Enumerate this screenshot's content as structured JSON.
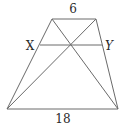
{
  "figure": {
    "type": "trapezoid",
    "labels": {
      "top_base": "6",
      "bottom_base": "18",
      "left_point": "X",
      "right_point": "Y"
    },
    "vertices": {
      "top_left": [
        52,
        19
      ],
      "top_right": [
        96,
        19
      ],
      "bottom_left": [
        7,
        109
      ],
      "bottom_right": [
        118,
        109
      ]
    },
    "segment_xy": {
      "from": [
        40,
        45
      ],
      "to": [
        102,
        45
      ]
    },
    "diagonal_intersection": [
      70,
      45
    ],
    "colors": {
      "line": "#6a6a6a",
      "text": "#2a2a2a",
      "background": "#ffffff"
    }
  }
}
